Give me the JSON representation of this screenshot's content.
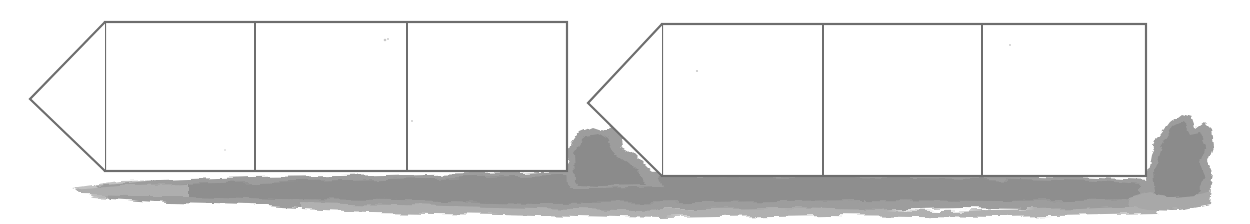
{
  "figure": {
    "kind": "scanned-line-drawing",
    "canvas": {
      "width": 1250,
      "height": 224
    },
    "background_color": "#ffffff",
    "stroke_color": "#6e6e6e",
    "stroke_width": 2.2,
    "fill_color": "#ffffff",
    "shadow_color": "#9a9a9a",
    "shadow_color_light": "#b4b4b4",
    "shapes": [
      {
        "name": "banner-arrow-left",
        "tip": {
          "x": 30,
          "y": 99
        },
        "body": {
          "x": 105,
          "y": 22,
          "width": 462,
          "height": 149
        },
        "cells": [
          {
            "label": "",
            "x": 105,
            "width": 150
          },
          {
            "label": "",
            "x": 255,
            "width": 152
          },
          {
            "label": "",
            "x": 407,
            "width": 160
          }
        ],
        "dividers": [
          255,
          407
        ]
      },
      {
        "name": "banner-arrow-right",
        "tip": {
          "x": 588,
          "y": 103
        },
        "body": {
          "x": 662,
          "y": 24,
          "width": 484,
          "height": 152
        },
        "cells": [
          {
            "label": "",
            "x": 662,
            "width": 161
          },
          {
            "label": "",
            "x": 823,
            "width": 159
          },
          {
            "label": "",
            "x": 982,
            "width": 164
          }
        ],
        "dividers": [
          823,
          982
        ]
      }
    ],
    "smudges": [
      {
        "name": "ground-shadow-main",
        "x": 75,
        "y": 168,
        "width": 1090,
        "height": 45
      },
      {
        "name": "smudge-between-shapes",
        "x": 563,
        "y": 126,
        "width": 100,
        "height": 60
      },
      {
        "name": "smudge-right-end",
        "x": 1146,
        "y": 112,
        "width": 72,
        "height": 100
      }
    ]
  }
}
